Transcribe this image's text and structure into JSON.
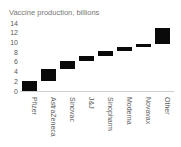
{
  "chart_data": {
    "type": "bar",
    "subtype": "waterfall",
    "title": "Vaccine production, billions",
    "categories": [
      "Pfizer",
      "AstraZeneca",
      "Sinovac",
      "J&J",
      "Sinopharm",
      "Moderna",
      "Novavax",
      "Other"
    ],
    "segments": [
      {
        "label": "Pfizer",
        "start": 0.0,
        "end": 2.0,
        "value": 2.0
      },
      {
        "label": "AstraZeneca",
        "start": 2.0,
        "end": 4.5,
        "value": 2.5
      },
      {
        "label": "Sinovac",
        "start": 4.5,
        "end": 6.2,
        "value": 1.7
      },
      {
        "label": "J&J",
        "start": 6.2,
        "end": 7.2,
        "value": 1.0
      },
      {
        "label": "Sinopharm",
        "start": 7.2,
        "end": 8.2,
        "value": 1.0
      },
      {
        "label": "Moderna",
        "start": 8.2,
        "end": 9.1,
        "value": 0.9
      },
      {
        "label": "Novavax",
        "start": 9.1,
        "end": 9.7,
        "value": 0.6
      },
      {
        "label": "Other",
        "start": 9.7,
        "end": 12.9,
        "value": 3.2
      }
    ],
    "xlabel": "",
    "ylabel": "",
    "ylim": [
      0,
      14
    ],
    "yticks": [
      0,
      2,
      4,
      6,
      8,
      10,
      12,
      14
    ],
    "grid": false,
    "legend": false,
    "colors": {
      "bar": "#0a0a0a",
      "axis_line": "#cfcfcf",
      "tick_text": "#5a5a5a",
      "title_text": "#767676",
      "background": "#ffffff"
    }
  }
}
